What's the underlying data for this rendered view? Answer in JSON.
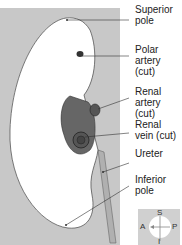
{
  "labels": [
    {
      "id": "superior-pole",
      "text": "Superior\npole",
      "lines": [
        "Superior",
        "pole"
      ]
    },
    {
      "id": "polar-artery",
      "lines": [
        "Polar",
        "artery (cut)"
      ]
    },
    {
      "id": "renal-artery",
      "lines": [
        "Renal",
        "artery (cut)"
      ]
    },
    {
      "id": "renal-vein",
      "lines": [
        "Renal",
        "vein (cut)"
      ]
    },
    {
      "id": "ureter",
      "lines": [
        "Ureter"
      ]
    },
    {
      "id": "inferior-pole",
      "lines": [
        "Inferior",
        "pole"
      ]
    }
  ],
  "compass": {
    "superior": "S",
    "inferior": "I",
    "anterior": "A",
    "posterior": "P"
  },
  "colors": {
    "background": "#c8c8c8",
    "kidney": "#ffffff",
    "vessel": "#555555",
    "ureter": "#aaaaaa"
  }
}
